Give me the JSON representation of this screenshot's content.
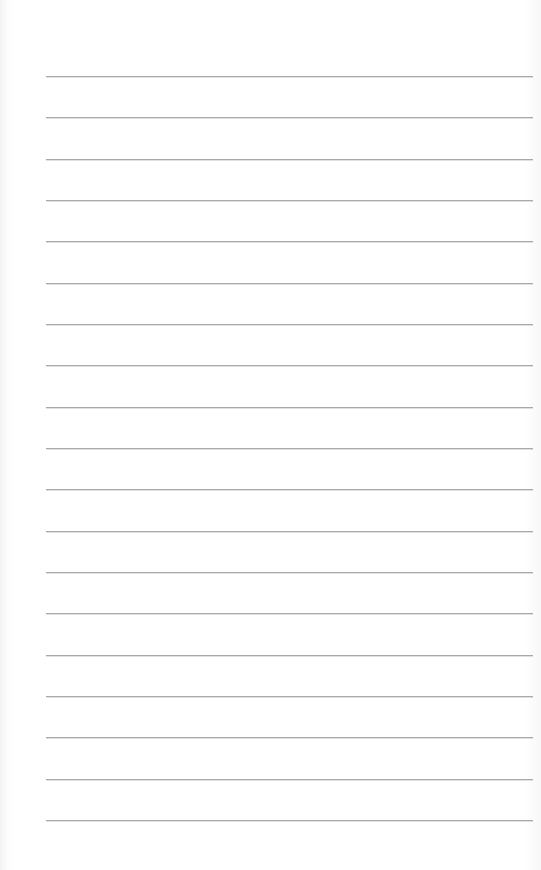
{
  "page": {
    "type": "lined-paper",
    "background_color": "#ffffff",
    "line_color": "#a9a9a9",
    "line_count": 19,
    "first_line_y": 76,
    "line_spacing": 41.33,
    "line_left": 46,
    "line_right": 533
  }
}
